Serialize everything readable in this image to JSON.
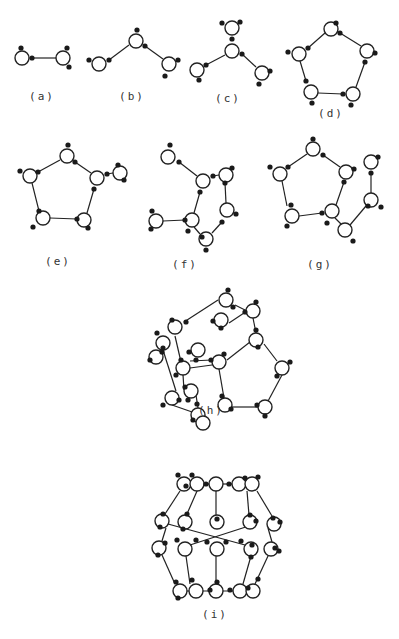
{
  "figure": {
    "background": "#ffffff",
    "ink": "#222222",
    "oxygen_radius": 7,
    "hydrogen_radius": 2.6,
    "panels": [
      {
        "id": "a",
        "label": "(a)",
        "label_pos": [
          42,
          100
        ],
        "oxygens": [
          [
            22,
            58
          ],
          [
            63,
            58
          ]
        ],
        "hydrogens": [
          [
            21,
            48
          ],
          [
            32,
            58
          ],
          [
            67,
            48
          ],
          [
            69,
            67
          ]
        ],
        "bonds": [
          [
            32,
            58,
            56,
            58
          ]
        ]
      },
      {
        "id": "b",
        "label": "(b)",
        "label_pos": [
          132,
          100
        ],
        "oxygens": [
          [
            99,
            64
          ],
          [
            136,
            41
          ],
          [
            169,
            64
          ]
        ],
        "hydrogens": [
          [
            89,
            60
          ],
          [
            109,
            60
          ],
          [
            137,
            30
          ],
          [
            145,
            46
          ],
          [
            178,
            60
          ],
          [
            165,
            76
          ]
        ],
        "bonds": [
          [
            109,
            60,
            129,
            45
          ],
          [
            145,
            46,
            163,
            59
          ]
        ]
      },
      {
        "id": "c",
        "label": "(c)",
        "label_pos": [
          228,
          102
        ],
        "oxygens": [
          [
            232,
            51
          ],
          [
            232,
            28
          ],
          [
            197,
            70
          ],
          [
            262,
            73
          ]
        ],
        "hydrogens": [
          [
            232,
            39
          ],
          [
            242,
            54
          ],
          [
            222,
            23
          ],
          [
            240,
            22
          ],
          [
            206,
            65
          ],
          [
            199,
            80
          ],
          [
            270,
            71
          ],
          [
            259,
            84
          ]
        ],
        "bonds": [
          [
            242,
            54,
            256,
            67
          ],
          [
            206,
            65,
            225,
            55
          ]
        ]
      },
      {
        "id": "d",
        "label": "(d)",
        "label_pos": [
          331,
          117
        ],
        "oxygens": [
          [
            331,
            29
          ],
          [
            299,
            54
          ],
          [
            367,
            51
          ],
          [
            311,
            92
          ],
          [
            353,
            94
          ]
        ],
        "hydrogens": [
          [
            336,
            23
          ],
          [
            340,
            33
          ],
          [
            288,
            52
          ],
          [
            308,
            48
          ],
          [
            375,
            53
          ],
          [
            365,
            62
          ],
          [
            306,
            81
          ],
          [
            312,
            103
          ],
          [
            343,
            94
          ],
          [
            351,
            105
          ]
        ],
        "bonds": [
          [
            308,
            48,
            325,
            33
          ],
          [
            340,
            33,
            361,
            46
          ],
          [
            365,
            62,
            356,
            87
          ],
          [
            343,
            94,
            318,
            93
          ],
          [
            306,
            81,
            300,
            61
          ]
        ]
      },
      {
        "id": "e",
        "label": "(e)",
        "label_pos": [
          58,
          265
        ],
        "oxygens": [
          [
            67,
            156
          ],
          [
            30,
            176
          ],
          [
            97,
            178
          ],
          [
            43,
            218
          ],
          [
            84,
            220
          ],
          [
            120,
            173
          ]
        ],
        "hydrogens": [
          [
            68,
            145
          ],
          [
            75,
            162
          ],
          [
            20,
            171
          ],
          [
            38,
            172
          ],
          [
            107,
            174
          ],
          [
            94,
            189
          ],
          [
            39,
            211
          ],
          [
            33,
            227
          ],
          [
            77,
            219
          ],
          [
            88,
            228
          ],
          [
            118,
            165
          ],
          [
            124,
            180
          ]
        ],
        "bonds": [
          [
            75,
            162,
            91,
            173
          ],
          [
            38,
            172,
            60,
            160
          ],
          [
            94,
            189,
            87,
            213
          ],
          [
            77,
            219,
            50,
            218
          ],
          [
            39,
            211,
            32,
            183
          ],
          [
            107,
            174,
            113,
            173
          ]
        ]
      },
      {
        "id": "f",
        "label": "(f)",
        "label_pos": [
          185,
          268
        ],
        "oxygens": [
          [
            168,
            157
          ],
          [
            203,
            181
          ],
          [
            226,
            175
          ],
          [
            227,
            210
          ],
          [
            192,
            220
          ],
          [
            156,
            221
          ],
          [
            206,
            239
          ]
        ],
        "hydrogens": [
          [
            170,
            145
          ],
          [
            179,
            162
          ],
          [
            213,
            176
          ],
          [
            200,
            192
          ],
          [
            232,
            168
          ],
          [
            225,
            183
          ],
          [
            236,
            214
          ],
          [
            222,
            222
          ],
          [
            185,
            220
          ],
          [
            188,
            231
          ],
          [
            152,
            211
          ],
          [
            151,
            229
          ],
          [
            202,
            237
          ],
          [
            206,
            250
          ]
        ],
        "bonds": [
          [
            179,
            162,
            197,
            176
          ],
          [
            213,
            176,
            219,
            175
          ],
          [
            200,
            192,
            194,
            213
          ],
          [
            225,
            183,
            226,
            203
          ],
          [
            222,
            222,
            212,
            233
          ],
          [
            185,
            220,
            163,
            221
          ],
          [
            194,
            227,
            200,
            234
          ]
        ]
      },
      {
        "id": "g",
        "label": "(g)",
        "label_pos": [
          320,
          268
        ],
        "oxygens": [
          [
            313,
            149
          ],
          [
            280,
            174
          ],
          [
            346,
            172
          ],
          [
            292,
            216
          ],
          [
            332,
            211
          ],
          [
            371,
            162
          ],
          [
            371,
            200
          ],
          [
            345,
            230
          ]
        ],
        "hydrogens": [
          [
            313,
            139
          ],
          [
            323,
            155
          ],
          [
            270,
            167
          ],
          [
            288,
            167
          ],
          [
            354,
            169
          ],
          [
            344,
            182
          ],
          [
            291,
            205
          ],
          [
            287,
            226
          ],
          [
            322,
            213
          ],
          [
            327,
            223
          ],
          [
            378,
            157
          ],
          [
            371,
            173
          ],
          [
            368,
            206
          ],
          [
            381,
            207
          ],
          [
            353,
            241
          ]
        ],
        "bonds": [
          [
            323,
            155,
            340,
            167
          ],
          [
            288,
            167,
            307,
            154
          ],
          [
            344,
            182,
            336,
            205
          ],
          [
            322,
            213,
            299,
            216
          ],
          [
            287,
            206,
            282,
            181
          ],
          [
            371,
            173,
            371,
            193
          ],
          [
            366,
            206,
            350,
            225
          ],
          [
            335,
            218,
            341,
            224
          ]
        ]
      },
      {
        "id": "h",
        "label": "(h)",
        "label_pos": [
          211,
          414
        ],
        "oxygens": [
          [
            226,
            300
          ],
          [
            175,
            327
          ],
          [
            253,
            311
          ],
          [
            221,
            320
          ],
          [
            256,
            340
          ],
          [
            163,
            343
          ],
          [
            198,
            350
          ],
          [
            156,
            357
          ],
          [
            219,
            362
          ],
          [
            183,
            368
          ],
          [
            282,
            368
          ],
          [
            191,
            391
          ],
          [
            172,
            398
          ],
          [
            225,
            405
          ],
          [
            198,
            415
          ],
          [
            265,
            407
          ],
          [
            203,
            423
          ]
        ],
        "bonds": [
          [
            235,
            305,
            247,
            311
          ],
          [
            184,
            322,
            218,
            300
          ],
          [
            229,
            323,
            247,
            311
          ],
          [
            253,
            318,
            256,
            333
          ],
          [
            264,
            344,
            277,
            361
          ],
          [
            227,
            360,
            250,
            342
          ],
          [
            190,
            361,
            212,
            360
          ],
          [
            282,
            375,
            267,
            403
          ],
          [
            232,
            407,
            260,
            407
          ],
          [
            219,
            369,
            224,
            398
          ],
          [
            183,
            375,
            184,
            390
          ],
          [
            175,
            336,
            181,
            362
          ],
          [
            190,
            368,
            212,
            365
          ],
          [
            163,
            350,
            176,
            391
          ],
          [
            198,
            408,
            196,
            395
          ],
          [
            172,
            405,
            195,
            413
          ]
        ],
        "hydrogens": [
          [
            228,
            290
          ],
          [
            233,
            307
          ],
          [
            256,
            302
          ],
          [
            245,
            312
          ],
          [
            213,
            321
          ],
          [
            221,
            328
          ],
          [
            256,
            330
          ],
          [
            258,
            347
          ],
          [
            172,
            320
          ],
          [
            186,
            322
          ],
          [
            157,
            333
          ],
          [
            163,
            348
          ],
          [
            189,
            352
          ],
          [
            196,
            360
          ],
          [
            150,
            360
          ],
          [
            162,
            352
          ],
          [
            211,
            360
          ],
          [
            224,
            354
          ],
          [
            181,
            360
          ],
          [
            176,
            375
          ],
          [
            290,
            362
          ],
          [
            277,
            376
          ],
          [
            185,
            387
          ],
          [
            188,
            400
          ],
          [
            163,
            405
          ],
          [
            179,
            400
          ],
          [
            222,
            396
          ],
          [
            231,
            409
          ],
          [
            193,
            420
          ],
          [
            197,
            404
          ],
          [
            257,
            405
          ],
          [
            265,
            416
          ]
        ]
      },
      {
        "id": "i",
        "label": "(i)",
        "label_pos": [
          215,
          618
        ],
        "oxygens": [
          [
            184,
            484
          ],
          [
            197,
            484
          ],
          [
            216,
            484
          ],
          [
            239,
            484
          ],
          [
            252,
            484
          ],
          [
            162,
            521
          ],
          [
            185,
            522
          ],
          [
            217,
            522
          ],
          [
            250,
            522
          ],
          [
            274,
            524
          ],
          [
            159,
            548
          ],
          [
            185,
            549
          ],
          [
            217,
            549
          ],
          [
            251,
            549
          ],
          [
            271,
            549
          ],
          [
            180,
            591
          ],
          [
            196,
            591
          ],
          [
            216,
            591
          ],
          [
            240,
            591
          ],
          [
            253,
            591
          ]
        ],
        "hydrogens": [
          [
            178,
            475
          ],
          [
            192,
            475
          ],
          [
            186,
            486
          ],
          [
            206,
            484
          ],
          [
            229,
            484
          ],
          [
            245,
            478
          ],
          [
            258,
            477
          ],
          [
            163,
            514
          ],
          [
            160,
            527
          ],
          [
            187,
            514
          ],
          [
            183,
            529
          ],
          [
            217,
            519
          ],
          [
            250,
            515
          ],
          [
            256,
            521
          ],
          [
            273,
            518
          ],
          [
            280,
            522
          ],
          [
            177,
            540
          ],
          [
            165,
            543
          ],
          [
            158,
            555
          ],
          [
            196,
            540
          ],
          [
            207,
            542
          ],
          [
            226,
            542
          ],
          [
            241,
            541
          ],
          [
            252,
            545
          ],
          [
            275,
            548
          ],
          [
            279,
            551
          ],
          [
            251,
            557
          ],
          [
            176,
            582
          ],
          [
            192,
            580
          ],
          [
            178,
            598
          ],
          [
            210,
            590
          ],
          [
            217,
            582
          ],
          [
            230,
            590
          ],
          [
            258,
            579
          ],
          [
            248,
            588
          ]
        ],
        "bonds": [
          [
            206,
            484,
            232,
            484
          ],
          [
            180,
            491,
            165,
            514
          ],
          [
            197,
            491,
            187,
            514
          ],
          [
            216,
            491,
            216,
            515
          ],
          [
            247,
            491,
            249,
            515
          ],
          [
            257,
            491,
            272,
            516
          ],
          [
            166,
            528,
            162,
            541
          ],
          [
            168,
            524,
            245,
            545
          ],
          [
            255,
            524,
            190,
            545
          ],
          [
            268,
            528,
            272,
            542
          ],
          [
            162,
            555,
            175,
            584
          ],
          [
            186,
            556,
            190,
            584
          ],
          [
            216,
            556,
            216,
            584
          ],
          [
            251,
            556,
            243,
            584
          ],
          [
            268,
            556,
            255,
            584
          ],
          [
            186,
            591,
            233,
            591
          ]
        ]
      }
    ]
  }
}
